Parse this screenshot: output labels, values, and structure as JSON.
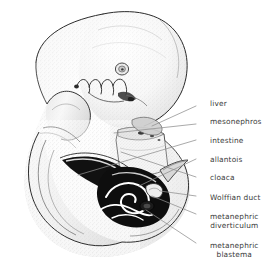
{
  "figure": {
    "background_color": "#ffffff",
    "ink_color": "#1a1a1a",
    "label_color": "#3a3a3a",
    "leader_color": "#8d8d8d"
  },
  "labels": [
    {
      "id": "liver",
      "line1": "liver",
      "line2": "",
      "text_x": 210,
      "text_y": 99,
      "leader": {
        "x1": 196,
        "y1": 106,
        "x2": 152,
        "y2": 126
      }
    },
    {
      "id": "mesonephros",
      "line1": "mesonephros",
      "line2": "",
      "text_x": 210,
      "text_y": 117,
      "leader": {
        "x1": 196,
        "y1": 124,
        "x2": 114,
        "y2": 133
      }
    },
    {
      "id": "intestine",
      "line1": "intestine",
      "line2": "",
      "text_x": 210,
      "text_y": 136,
      "leader": {
        "x1": 196,
        "y1": 140,
        "x2": 78,
        "y2": 175
      }
    },
    {
      "id": "allantois",
      "line1": "allantois",
      "line2": "",
      "text_x": 210,
      "text_y": 155,
      "leader": {
        "x1": 196,
        "y1": 159,
        "x2": 139,
        "y2": 186
      }
    },
    {
      "id": "cloaca",
      "line1": "cloaca",
      "line2": "",
      "text_x": 210,
      "text_y": 173,
      "leader": {
        "x1": 196,
        "y1": 177,
        "x2": 121,
        "y2": 152
      }
    },
    {
      "id": "wolffian-duct",
      "line1": "Wolffian duct",
      "line2": "",
      "text_x": 210,
      "text_y": 193,
      "leader": {
        "x1": 196,
        "y1": 196,
        "x2": 160,
        "y2": 191
      }
    },
    {
      "id": "metanephric-diverticulum",
      "line1": "metanephric",
      "line2": "diverticulum",
      "text_x": 210,
      "text_y": 212,
      "leader": {
        "x1": 196,
        "y1": 214,
        "x2": 152,
        "y2": 196
      }
    },
    {
      "id": "metanephric-blastema",
      "line1": "metanephric",
      "line2": "blastema",
      "text_x": 210,
      "text_y": 241,
      "leader": {
        "x1": 196,
        "y1": 243,
        "x2": 146,
        "y2": 210
      }
    }
  ],
  "anatomy_features": [
    {
      "id": "head",
      "description": "large rounded cephalic region, upper right"
    },
    {
      "id": "otic-vesicle",
      "description": "small circular otic vesicle on head"
    },
    {
      "id": "pharyngeal-arches",
      "description": "row of four scalloped pharyngeal arches below head"
    },
    {
      "id": "heart-bulge",
      "description": "cardiac prominence, mid-left"
    },
    {
      "id": "limb-bud",
      "description": "forelimb bud / body wall fold, lower left"
    },
    {
      "id": "tail",
      "description": "curled caudal tail region, bottom"
    },
    {
      "id": "mesonephros-body",
      "description": "pale vertical ridge in trunk"
    },
    {
      "id": "cloaca-dark",
      "description": "dark ink-filled cloacal region"
    },
    {
      "id": "intestine-loop",
      "description": "dark elongated gut tube running caudally"
    },
    {
      "id": "allantois-stalk",
      "description": "narrow stalk extending right from cloaca"
    },
    {
      "id": "wolffian-duct-coil",
      "description": "white coiled duct within dark cloaca"
    },
    {
      "id": "metanephric-bud",
      "description": "small bud near duct coil"
    }
  ]
}
